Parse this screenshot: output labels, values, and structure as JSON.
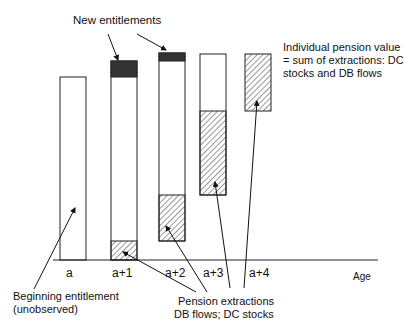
{
  "labels": {
    "new_entitlements": "New entitlements",
    "pension_value_line1": "Individual pension value",
    "pension_value_line2": "= sum of extractions:  DC",
    "pension_value_line3": "stocks and DB flows",
    "beginning_line1": "Beginning entitlement",
    "beginning_line2": "(unobserved)",
    "extractions_line1": "Pension extractions",
    "extractions_line2": "DB flows;  DC stocks",
    "axis_label": "Age"
  },
  "ticks": [
    "a",
    "a+1",
    "a+2",
    "a+3",
    "a+4"
  ],
  "colors": {
    "outline": "#222222",
    "new_entitlement_fill": "#333333",
    "hatch": "#333333",
    "background": "#ffffff"
  },
  "bars": [
    {
      "tick": "a",
      "segments": [
        {
          "type": "white",
          "label": "beginning entitlement"
        }
      ]
    },
    {
      "tick": "a+1",
      "segments": [
        {
          "type": "dark",
          "label": "new entitlement"
        },
        {
          "type": "white"
        },
        {
          "type": "hatched",
          "label": "extraction"
        }
      ]
    },
    {
      "tick": "a+2",
      "segments": [
        {
          "type": "dark",
          "label": "new entitlement"
        },
        {
          "type": "white"
        },
        {
          "type": "hatched",
          "label": "extraction"
        }
      ]
    },
    {
      "tick": "a+3",
      "segments": [
        {
          "type": "white"
        },
        {
          "type": "hatched",
          "label": "extraction"
        }
      ]
    },
    {
      "tick": "a+4",
      "segments": [
        {
          "type": "hatched",
          "label": "extraction"
        }
      ]
    }
  ]
}
